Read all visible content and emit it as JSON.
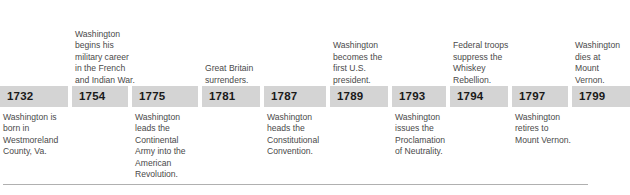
{
  "figure": {
    "type": "timeline",
    "orientation": "horizontal",
    "colors": {
      "chip_background": "#d4d4d4",
      "year_text": "#1a1a1a",
      "caption_text": "#4a4a4a",
      "rule": "#b0b0b0",
      "page_background": "#ffffff"
    }
  },
  "events": [
    {
      "year": "1732",
      "caption": "Washington is\nborn in\nWestmoreland\nCounty, Va.",
      "position": "below",
      "box_x": 0,
      "box_w": 68,
      "caption_x": 3
    },
    {
      "year": "1754",
      "caption": "Washington\nbegins his\nmilitary career\nin the French\nand Indian War.",
      "position": "above",
      "box_x": 72,
      "box_w": 56,
      "caption_x": 75
    },
    {
      "year": "1775",
      "caption": "Washington\nleads the\nContinental\nArmy into the\nAmerican\nRevolution.",
      "position": "below",
      "box_x": 132,
      "box_w": 66,
      "caption_x": 135
    },
    {
      "year": "1781",
      "caption": "Great Britain\nsurrenders.",
      "position": "above",
      "box_x": 202,
      "box_w": 58,
      "caption_x": 205
    },
    {
      "year": "1787",
      "caption": "Washington\nheads the\nConstitutional\nConvention.",
      "position": "below",
      "box_x": 264,
      "box_w": 62,
      "caption_x": 267
    },
    {
      "year": "1789",
      "caption": "Washington\nbecomes the\nfirst U.S.\npresident.",
      "position": "above",
      "box_x": 330,
      "box_w": 58,
      "caption_x": 333
    },
    {
      "year": "1793",
      "caption": "Washington\nissues the\nProclamation\nof Neutrality.",
      "position": "below",
      "box_x": 392,
      "box_w": 54,
      "caption_x": 395
    },
    {
      "year": "1794",
      "caption": "Federal troops\nsuppress the\nWhiskey\nRebellion.",
      "position": "above",
      "box_x": 450,
      "box_w": 58,
      "caption_x": 453
    },
    {
      "year": "1797",
      "caption": "Washington\nretires to\nMount Vernon.",
      "position": "below",
      "box_x": 512,
      "box_w": 56,
      "caption_x": 515
    },
    {
      "year": "1799",
      "caption": "Washington\ndies at\nMount\nVernon.",
      "position": "above",
      "box_x": 572,
      "box_w": 58,
      "caption_x": 575
    }
  ]
}
